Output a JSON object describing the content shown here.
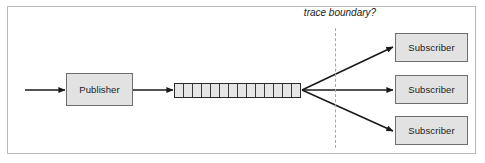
{
  "diagram": {
    "title_label": "trace boundary?",
    "colors": {
      "frame_border": "#b9b9b9",
      "box_fill": "#e2e2e2",
      "box_border": "#6e6e6e",
      "arrow": "#1a1a1a",
      "dashed_line": "#a8a8a8",
      "queue_fill": "#e6e6e6",
      "queue_border": "#2a2a2a"
    },
    "publisher": {
      "label": "Publisher"
    },
    "queue": {
      "cell_count": 14
    },
    "subscribers": [
      {
        "label": "Subscriber"
      },
      {
        "label": "Subscriber"
      },
      {
        "label": "Subscriber"
      }
    ]
  }
}
